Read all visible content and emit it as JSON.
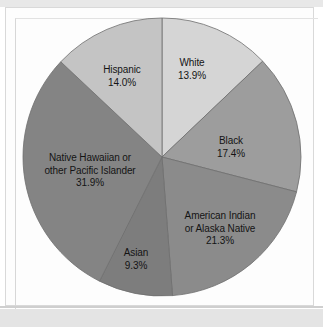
{
  "figure": {
    "background_color": "#ffffff",
    "frame_color": "#d9d9d9",
    "band_color": "#e4e4e4"
  },
  "chart_data": {
    "type": "pie",
    "title": "",
    "subtitle": "",
    "xlabel": "",
    "ylabel": "",
    "legend_position": "none",
    "labels_inside_slices": true,
    "start_angle_deg": 90,
    "direction": "clockwise",
    "categories": [
      "White",
      "Black",
      "American Indian or Alaska Native",
      "Asian",
      "Native Hawaiian or other Pacific Islander",
      "Hispanic"
    ],
    "values": [
      13.9,
      17.4,
      21.3,
      9.3,
      31.9,
      14.0
    ],
    "value_suffix": "%",
    "slices": [
      {
        "name": "White",
        "label_line1": "White",
        "label_line2": "",
        "value": 13.9,
        "value_text": "13.9%",
        "color": "#d5d5d5"
      },
      {
        "name": "Black",
        "label_line1": "Black",
        "label_line2": "",
        "value": 17.4,
        "value_text": "17.4%",
        "color": "#9d9d9d"
      },
      {
        "name": "American Indian or Alaska Native",
        "label_line1": "American Indian",
        "label_line2": "or Alaska Native",
        "value": 21.3,
        "value_text": "21.3%",
        "color": "#8b8b8b"
      },
      {
        "name": "Asian",
        "label_line1": "Asian",
        "label_line2": "",
        "value": 9.3,
        "value_text": "9.3%",
        "color": "#7d7d7d"
      },
      {
        "name": "Native Hawaiian or other Pacific Islander",
        "label_line1": "Native Hawaiian or",
        "label_line2": "other Pacific Islander",
        "value": 31.9,
        "value_text": "31.9%",
        "color": "#848484"
      },
      {
        "name": "Hispanic",
        "label_line1": "Hispanic",
        "label_line2": "",
        "value": 14.0,
        "value_text": "14.0%",
        "color": "#c4c4c4"
      }
    ]
  },
  "label_positions": [
    {
      "left": 146,
      "top": 50,
      "width": 82
    },
    {
      "left": 185,
      "top": 128,
      "width": 82
    },
    {
      "left": 160,
      "top": 203,
      "width": 110
    },
    {
      "left": 96,
      "top": 240,
      "width": 70
    },
    {
      "left": 20,
      "top": 145,
      "width": 130
    },
    {
      "left": 75,
      "top": 57,
      "width": 84
    }
  ]
}
